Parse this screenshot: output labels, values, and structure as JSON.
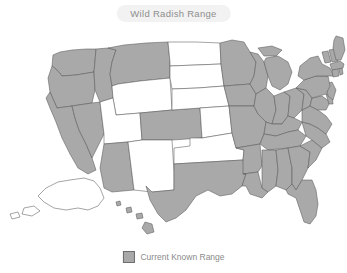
{
  "title": {
    "text": "Wild Radish Range"
  },
  "legend": {
    "swatch_name": "range-swatch",
    "label": "Current Known Range",
    "swatch_color": "#a9a9a9"
  },
  "colors": {
    "range_fill": "#a9a9a9",
    "no_range_fill": "#ffffff",
    "border": "#5a5a5a",
    "background": "#ffffff",
    "title_pill_bg": "#f2f2f2",
    "title_text": "#8e8e8e",
    "legend_text": "#8a8a8a"
  },
  "map_data": {
    "type": "choropleth",
    "region": "United States",
    "categories": [
      "Current Known Range",
      "Not in range"
    ],
    "states_in_range": [
      "Washington",
      "Oregon",
      "California",
      "Nevada",
      "Idaho",
      "Montana",
      "Arizona",
      "Colorado",
      "Texas",
      "Minnesota",
      "Iowa",
      "Missouri",
      "Arkansas",
      "Louisiana",
      "Wisconsin",
      "Illinois",
      "Michigan",
      "Indiana",
      "Ohio",
      "Kentucky",
      "Tennessee",
      "Mississippi",
      "Alabama",
      "Georgia",
      "Florida",
      "South Carolina",
      "North Carolina",
      "Virginia",
      "West Virginia",
      "Maryland",
      "Delaware",
      "New Jersey",
      "Pennsylvania",
      "New York",
      "Connecticut",
      "Rhode Island",
      "Massachusetts",
      "Vermont",
      "New Hampshire",
      "Maine",
      "Hawaii"
    ],
    "states_not_in_range": [
      "Wyoming",
      "Utah",
      "New Mexico",
      "North Dakota",
      "South Dakota",
      "Nebraska",
      "Kansas",
      "Oklahoma",
      "Alaska"
    ]
  }
}
